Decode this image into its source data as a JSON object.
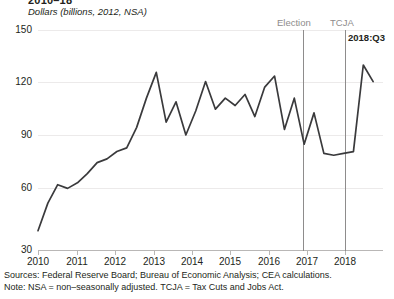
{
  "figure": {
    "title_clipped": "2010–18",
    "subtitle": "Dollars (billions, 2012, NSA)",
    "end_label": "2018:Q3"
  },
  "annotations": {
    "election_label": "Election",
    "tcja_label": "TCJA"
  },
  "footnotes": {
    "sources": "Sources: Federal Reserve Board; Bureau of Economic Analysis; CEA calculations.",
    "note": "Note: NSA = non–seasonally adjusted. TCJA = Tax Cuts and Jobs Act."
  },
  "colors": {
    "line": "#3a3a3c",
    "grid": "#eceaea",
    "axis": "#b9b7b6",
    "marker": "#8e8c8c",
    "text": "#231f20"
  },
  "chart_data": {
    "type": "line",
    "title": "2010–18",
    "subtitle": "Dollars (billions, 2012, NSA)",
    "xlabel": "",
    "ylabel": "Dollars (billions, 2012, NSA)",
    "ylim": [
      30,
      150
    ],
    "yticks": [
      30,
      60,
      90,
      120,
      150
    ],
    "ytick_labels": [
      "30",
      "60",
      "90",
      "120",
      "150"
    ],
    "xlim": [
      2010.0,
      2018.75
    ],
    "xticks": [
      2010,
      2011,
      2012,
      2013,
      2014,
      2015,
      2016,
      2017,
      2018
    ],
    "xtick_labels": [
      "2010",
      "2011",
      "2012",
      "2013",
      "2014",
      "2015",
      "2016",
      "2017",
      "2018"
    ],
    "grid": true,
    "legend": false,
    "x": [
      2010.0,
      2010.25,
      2010.5,
      2010.75,
      2011.0,
      2011.25,
      2011.5,
      2011.75,
      2012.0,
      2012.25,
      2012.5,
      2012.75,
      2013.0,
      2013.25,
      2013.5,
      2013.75,
      2014.0,
      2014.25,
      2014.5,
      2014.75,
      2015.0,
      2015.25,
      2015.5,
      2015.75,
      2016.0,
      2016.25,
      2016.5,
      2016.75,
      2017.0,
      2017.25,
      2017.5,
      2017.75,
      2018.0,
      2018.25,
      2018.5
    ],
    "series": [
      {
        "name": "Business fixed investment in structures",
        "values": [
          41,
          56,
          66,
          64,
          67,
          72,
          78,
          80,
          84,
          86,
          97,
          113,
          127,
          100,
          111,
          93,
          106,
          122,
          107,
          113,
          109,
          115,
          103,
          119,
          125,
          96,
          113,
          88,
          105,
          83,
          82,
          83,
          84,
          131,
          122
        ]
      }
    ],
    "vlines": [
      {
        "label": "Election",
        "x": 2016.85
      },
      {
        "label": "TCJA",
        "x": 2017.95
      }
    ],
    "point_labels": [
      {
        "label": "2018:Q3",
        "x": 2018.5,
        "y": 134
      }
    ]
  }
}
